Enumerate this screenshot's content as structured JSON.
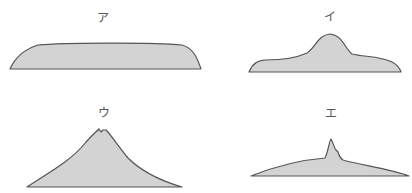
{
  "figure": {
    "fill_color": "#d3d3d3",
    "stroke_color": "#555555",
    "panels": [
      {
        "id": "a",
        "label": "ア",
        "shape": "flat-plateau (lava plateau)",
        "label_pos": [
          103,
          12
        ]
      },
      {
        "id": "i",
        "label": "イ",
        "shape": "dome bump on low base (lava dome)",
        "label_pos": [
          330,
          11
        ]
      },
      {
        "id": "u",
        "label": "ウ",
        "shape": "stratovolcano cone with crater notch",
        "label_pos": [
          104,
          107
        ]
      },
      {
        "id": "e",
        "label": "エ",
        "shape": "gentle shield with central spike",
        "label_pos": [
          331,
          108
        ]
      }
    ]
  }
}
